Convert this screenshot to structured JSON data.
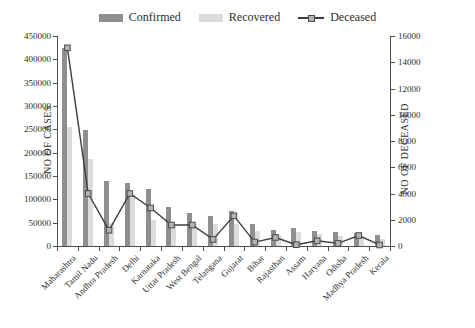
{
  "chart_data": {
    "type": "bar",
    "title": "",
    "categories": [
      "Maharashtra",
      "Tamil Nadu",
      "Andhra Pradesh",
      "Delhi",
      "Karnataka",
      "Uttar Pradesh",
      "West Bengal",
      "Telangana",
      "Gujarat",
      "Bihar",
      "Rajasthan",
      "Assam",
      "Haryana",
      "Odisha",
      "Madhya Pradesh",
      "Kerala"
    ],
    "series": [
      {
        "name": "Confirmed",
        "type": "bar",
        "axis": "left",
        "color": "#8f8f8f",
        "values": [
          425000,
          248000,
          140000,
          135000,
          122000,
          84000,
          70000,
          64000,
          74000,
          48000,
          34000,
          38000,
          33000,
          29000,
          27000,
          24000
        ]
      },
      {
        "name": "Recovered",
        "type": "bar",
        "axis": "left",
        "color": "#dcdcdc",
        "values": [
          255000,
          186000,
          49000,
          110000,
          56000,
          45000,
          48000,
          47000,
          47000,
          33000,
          24000,
          29000,
          26000,
          22000,
          20000,
          16000
        ]
      },
      {
        "name": "Deceased",
        "type": "line",
        "axis": "right",
        "color": "#3d3d3d",
        "marker": "square",
        "marker_fill": "#b3b3b3",
        "marker_stroke": "#4a4a4a",
        "values": [
          15100,
          4000,
          1200,
          4000,
          2900,
          1600,
          1600,
          500,
          2300,
          300,
          650,
          100,
          400,
          200,
          800,
          80
        ]
      }
    ],
    "left_axis": {
      "label": "NO OF CASES",
      "min": 0,
      "max": 450000,
      "step": 50000,
      "ticks": [
        "0",
        "50000",
        "100000",
        "150000",
        "200000",
        "250000",
        "300000",
        "350000",
        "400000",
        "450000"
      ]
    },
    "right_axis": {
      "label": "NO OF DECEASED",
      "min": 0,
      "max": 16000,
      "step": 2000,
      "ticks": [
        "0",
        "2000",
        "4000",
        "6000",
        "8000",
        "10000",
        "12000",
        "14000",
        "16000"
      ]
    },
    "legend_position": "top",
    "grid": false,
    "axis_color": "#4f4f4f",
    "text_color": "#2e2e2e"
  }
}
